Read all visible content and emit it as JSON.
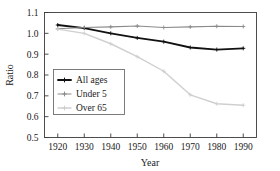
{
  "chart_data": {
    "type": "line",
    "title": "",
    "xlabel": "Year",
    "ylabel": "Ratio",
    "x": [
      1920,
      1930,
      1940,
      1950,
      1960,
      1970,
      1980,
      1990
    ],
    "xticklabels": [
      "1920",
      "1930",
      "1940",
      "1950",
      "1960",
      "1970",
      "1980",
      "1990"
    ],
    "yticklabels": [
      "0.5",
      "0.6",
      "0.7",
      "0.8",
      "0.9",
      "1.0",
      "1.1"
    ],
    "yticks": [
      0.5,
      0.6,
      0.7,
      0.8,
      0.9,
      1.0,
      1.1
    ],
    "xlim": [
      1915,
      1995
    ],
    "ylim": [
      0.5,
      1.1
    ],
    "grid": false,
    "legend_position": "lower-left-inside",
    "series": [
      {
        "name": "All ages",
        "color": "#111111",
        "linewidth": 1.9,
        "marker": "plus",
        "values": [
          1.04,
          1.025,
          1.0,
          0.978,
          0.96,
          0.932,
          0.922,
          0.928
        ]
      },
      {
        "name": "Under 5",
        "color": "#8a8a8a",
        "linewidth": 1.1,
        "marker": "plus",
        "values": [
          1.022,
          1.028,
          1.031,
          1.035,
          1.028,
          1.031,
          1.034,
          1.033
        ]
      },
      {
        "name": "Over 65",
        "color": "#cfcfcf",
        "linewidth": 1.4,
        "marker": "plus",
        "values": [
          1.02,
          1.0,
          0.95,
          0.888,
          0.818,
          0.705,
          0.662,
          0.655
        ]
      }
    ]
  },
  "legend": {
    "entries": [
      {
        "label": "All ages"
      },
      {
        "label": "Under 5"
      },
      {
        "label": "Over 65"
      }
    ]
  },
  "axes": {
    "y_title": "Ratio",
    "x_title": "Year"
  }
}
